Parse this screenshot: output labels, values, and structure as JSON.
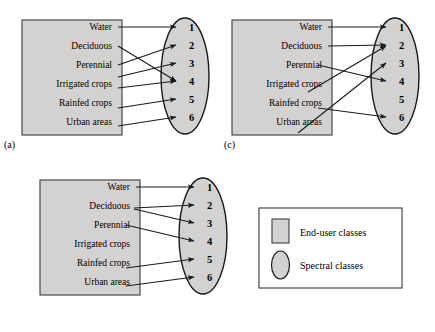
{
  "figure": {
    "background_color": "#ffffff",
    "box_fill": "#d4d2d0",
    "box_stroke": "#4a4a4a",
    "ellipse_fill": "#d4d2d0",
    "ellipse_stroke": "#1a1a1a",
    "arrow_color": "#1a1a1a"
  },
  "end_user_classes": [
    "Water",
    "Deciduous",
    "Perennial",
    "Irrigated crops",
    "Rainfed crops",
    "Urban areas"
  ],
  "spectral_classes": [
    "1",
    "2",
    "3",
    "4",
    "5",
    "6"
  ],
  "panels": [
    {
      "id": "a",
      "caption": "(a)",
      "mappings": [
        {
          "from": "Water",
          "to": "1"
        },
        {
          "from": "Deciduous",
          "to": "4"
        },
        {
          "from": "Perennial",
          "to": "2"
        },
        {
          "from": "Irrigated crops",
          "to": "3"
        },
        {
          "from": "Irrigated crops",
          "to": "4"
        },
        {
          "from": "Rainfed crops",
          "to": "5"
        },
        {
          "from": "Urban areas",
          "to": "6"
        }
      ]
    },
    {
      "id": "b",
      "caption": "(b)",
      "mappings": [
        {
          "from": "Water",
          "to": "1"
        },
        {
          "from": "Deciduous",
          "to": "2"
        },
        {
          "from": "Deciduous",
          "to": "3"
        },
        {
          "from": "Perennial",
          "to": "4"
        },
        {
          "from": "Rainfed crops",
          "to": "5"
        },
        {
          "from": "Urban areas",
          "to": "6"
        }
      ]
    },
    {
      "id": "c",
      "caption": "(c)",
      "mappings": [
        {
          "from": "Water",
          "to": "1"
        },
        {
          "from": "Deciduous",
          "to": "2"
        },
        {
          "from": "Perennial",
          "to": "4"
        },
        {
          "from": "Irrigated crops",
          "to": "2"
        },
        {
          "from": "Rainfed crops",
          "to": "6"
        },
        {
          "from": "Urban areas",
          "to": "3"
        }
      ]
    }
  ],
  "legend": {
    "items": [
      {
        "shape": "rectangle",
        "label": "End-user classes"
      },
      {
        "shape": "ellipse",
        "label": "Spectral classes"
      }
    ]
  }
}
